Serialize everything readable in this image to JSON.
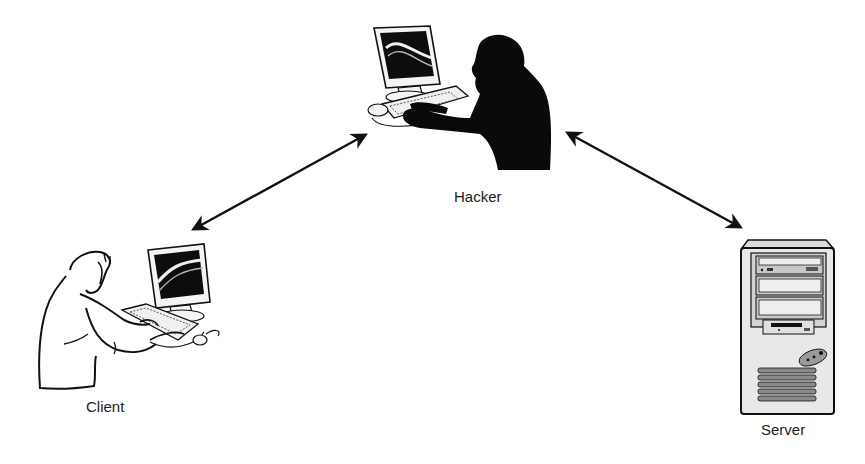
{
  "diagram": {
    "type": "network-attack-topology",
    "nodes": [
      {
        "id": "client",
        "label": "Client",
        "icon": "user-at-computer-icon"
      },
      {
        "id": "hacker",
        "label": "Hacker",
        "icon": "hacker-silhouette-icon"
      },
      {
        "id": "server",
        "label": "Server",
        "icon": "server-tower-icon"
      }
    ],
    "edges": [
      {
        "from": "client",
        "to": "hacker",
        "direction": "bidirectional"
      },
      {
        "from": "hacker",
        "to": "server",
        "direction": "bidirectional"
      }
    ],
    "colors": {
      "background": "#ffffff",
      "stroke": "#111111",
      "silhouette": "#0a0a0a",
      "server_body": "#e6e6e6",
      "server_bay": "#cfcfcf"
    }
  }
}
